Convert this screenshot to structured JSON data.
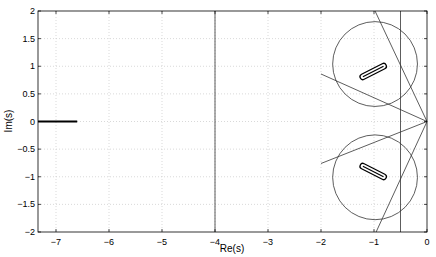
{
  "chart_data": {
    "type": "scatter",
    "title": "",
    "xlabel": "Re(s)",
    "ylabel": "Im(s)",
    "xlim": [
      -7.34,
      0
    ],
    "ylim": [
      -2,
      2
    ],
    "grid": true,
    "legend": null,
    "xticks": [
      -7,
      -6,
      -5,
      -4,
      -3,
      -2,
      -1,
      0
    ],
    "yticks": [
      -2,
      -1.5,
      -1,
      -0.5,
      0,
      0.5,
      1,
      1.5,
      2
    ],
    "xtick_labels": [
      "−7",
      "−6",
      "−5",
      "−4",
      "−3",
      "−2",
      "−1",
      "0"
    ],
    "ytick_labels": [
      "−2",
      "−1.5",
      "−1",
      "−0.5",
      "0",
      "0.5",
      "1",
      "1.5",
      "2"
    ],
    "annotations": {
      "vertical_lines": [
        {
          "x": -4,
          "description": "stability margin boundary"
        },
        {
          "x": -0.5,
          "description": "boundary"
        }
      ],
      "rays_from_origin": [
        {
          "to": [
            -0.98,
            2
          ]
        },
        {
          "to": [
            -0.96,
            -2
          ]
        },
        {
          "to": [
            -2,
            0.86
          ]
        },
        {
          "to": [
            -2,
            -0.76
          ]
        }
      ],
      "circles": [
        {
          "center": [
            -0.98,
            1.04
          ],
          "radius": 0.8
        },
        {
          "center": [
            -0.98,
            -1.01
          ],
          "radius": 0.8
        }
      ],
      "pole_clusters": [
        {
          "description": "thick bar on real axis",
          "from": [
            -7.34,
            0
          ],
          "to": [
            -6.6,
            0
          ]
        },
        {
          "description": "upper complex pole band",
          "from": [
            -1.21,
            0.81
          ],
          "to": [
            -0.82,
            1.0
          ]
        },
        {
          "description": "lower complex pole band",
          "from": [
            -1.21,
            -0.81
          ],
          "to": [
            -0.82,
            -1.0
          ]
        }
      ]
    }
  }
}
